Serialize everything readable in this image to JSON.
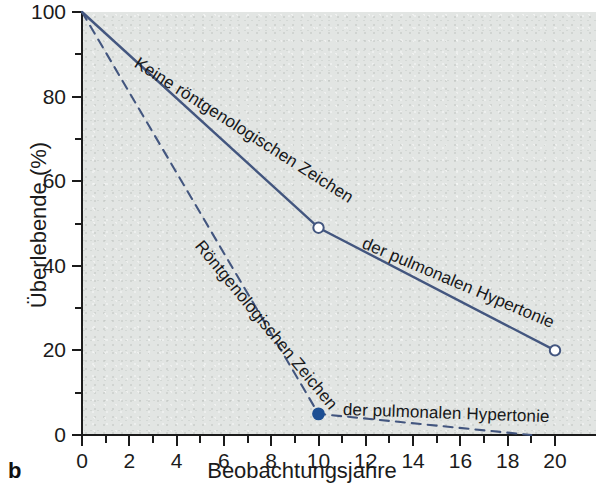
{
  "panel": {
    "label": "b"
  },
  "chart_data": {
    "type": "line",
    "title": "",
    "xlabel": "Beobachtungsjahre",
    "ylabel": "Überlebende (%)",
    "xlim": [
      0,
      20
    ],
    "ylim": [
      0,
      100
    ],
    "xticks": [
      0,
      2,
      4,
      6,
      8,
      10,
      12,
      14,
      16,
      18,
      20
    ],
    "xticklabels": [
      "0",
      "2",
      "4",
      "6",
      "8",
      "10",
      "12",
      "14",
      "16",
      "18",
      "20"
    ],
    "xminor_ticks": [
      1,
      3,
      5,
      7,
      9,
      11,
      13,
      15,
      17,
      19
    ],
    "yticks": [
      0,
      20,
      40,
      60,
      80,
      100
    ],
    "yticklabels": [
      "0",
      "20",
      "40",
      "60",
      "80",
      "100"
    ],
    "yminor_ticks": [
      10,
      30,
      50,
      70,
      90
    ],
    "grid": false,
    "legend": "inline-curve-labels",
    "plot_background": "#e2e5e3",
    "series": [
      {
        "name": "Keine röntgenologischen Zeichen der pulmonalen Hypertonie",
        "style": "solid",
        "color": "#43567f",
        "marker": "open-circle",
        "x": [
          0,
          10,
          20
        ],
        "values": [
          100,
          49,
          20
        ],
        "markers_at": [
          [
            10,
            49
          ],
          [
            20,
            20
          ]
        ]
      },
      {
        "name": "Röntgenologischen Zeichen der pulmonalen Hypertonie",
        "style": "dashed",
        "color": "#43567f",
        "marker": "filled-circle",
        "x": [
          0,
          10,
          19
        ],
        "values": [
          100,
          5,
          0
        ],
        "markers_at": [
          [
            10,
            5
          ]
        ]
      }
    ],
    "annotations": [
      {
        "text": "Keine röntgenologischen Zeichen",
        "series": "solid",
        "placement": "along-line-upper"
      },
      {
        "text": "der pulmonalen Hypertonie",
        "series": "solid",
        "placement": "along-line-lower"
      },
      {
        "text": "Röntgenologischen Zeichen",
        "series": "dashed",
        "placement": "along-line-upper"
      },
      {
        "text": "der pulmonalen Hypertonie",
        "series": "dashed",
        "placement": "along-line-lower"
      }
    ]
  },
  "axis": {
    "y_title": "Überlebende (%)",
    "x_title": "Beobachtungsjahre",
    "y_labels": [
      "100",
      "80",
      "60",
      "40",
      "20",
      "0"
    ],
    "x_labels": [
      "0",
      "2",
      "4",
      "6",
      "8",
      "10",
      "12",
      "14",
      "16",
      "18",
      "20"
    ]
  },
  "labels": {
    "solid_line_1": "Keine röntgenologischen Zeichen",
    "solid_line_2": "der pulmonalen Hypertonie",
    "dashed_line_1": "Röntgenologischen Zeichen",
    "dashed_line_2": "der pulmonalen Hypertonie"
  },
  "colors": {
    "line": "#43567f",
    "axis": "#1b1b1b",
    "plot_bg": "#e2e5e3",
    "page_bg": "#ffffff",
    "marker_fill_open": "#ffffff",
    "marker_fill_solid": "#1d4f93"
  }
}
